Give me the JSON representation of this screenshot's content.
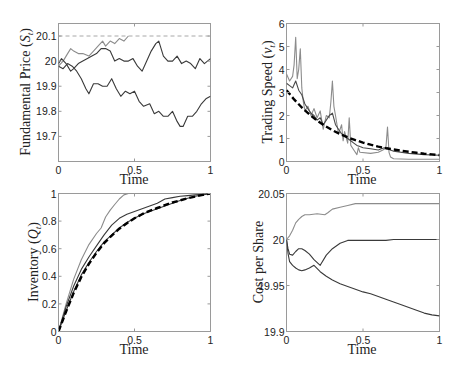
{
  "chart_data": [
    {
      "id": "price",
      "type": "line",
      "title": "",
      "xlabel": "Time",
      "ylabel": "Fundamental Price (S_t)",
      "ylabel_main": "Fundamental Price ",
      "ylabel_sym": "S",
      "ylabel_sub": "t",
      "xlim": [
        0,
        1
      ],
      "ylim": [
        19.6,
        20.15
      ],
      "xticks": [
        0,
        0.5,
        1
      ],
      "xtick_labels": [
        "0",
        "0.5",
        "1"
      ],
      "yticks": [
        19.7,
        19.8,
        19.9,
        20,
        20.1
      ],
      "ytick_labels": [
        "19.7",
        "19.8",
        "19.9",
        "20",
        "20.1"
      ],
      "grid": false,
      "series": [
        {
          "name": "barrier",
          "style": "dashed",
          "color": "#a8a8a8",
          "x": [
            0,
            1
          ],
          "y": [
            20.1,
            20.1
          ]
        },
        {
          "name": "path-hits-barrier",
          "style": "solid",
          "color": "#8c8c8c",
          "x": [
            0,
            0.03,
            0.06,
            0.08,
            0.1,
            0.13,
            0.16,
            0.2,
            0.23,
            0.26,
            0.29,
            0.31,
            0.34,
            0.37,
            0.4,
            0.43,
            0.46
          ],
          "y": [
            19.98,
            20.0,
            20.03,
            20.05,
            20.04,
            20.03,
            20.03,
            20.02,
            20.04,
            20.06,
            20.08,
            20.06,
            20.08,
            20.07,
            20.09,
            20.08,
            20.1
          ]
        },
        {
          "name": "path-mid",
          "style": "solid",
          "color": "#3a3a3a",
          "x": [
            0,
            0.02,
            0.05,
            0.08,
            0.1,
            0.13,
            0.16,
            0.19,
            0.22,
            0.25,
            0.28,
            0.31,
            0.34,
            0.37,
            0.4,
            0.43,
            0.46,
            0.49,
            0.52,
            0.55,
            0.58,
            0.61,
            0.64,
            0.66,
            0.69,
            0.72,
            0.75,
            0.78,
            0.81,
            0.84,
            0.87,
            0.9,
            0.93,
            0.96,
            1.0
          ],
          "y": [
            19.99,
            20.01,
            19.99,
            19.96,
            19.97,
            19.99,
            20.0,
            20.01,
            20.02,
            20.03,
            20.05,
            20.05,
            20.04,
            20.0,
            20.01,
            20.0,
            20.0,
            20.01,
            19.98,
            19.96,
            20.0,
            20.04,
            20.07,
            20.08,
            20.02,
            20.0,
            20.0,
            20.02,
            19.99,
            20.0,
            19.99,
            19.97,
            20.01,
            19.99,
            20.01
          ]
        },
        {
          "name": "path-low",
          "style": "solid",
          "color": "#3a3a3a",
          "x": [
            0,
            0.03,
            0.06,
            0.09,
            0.12,
            0.15,
            0.18,
            0.2,
            0.23,
            0.26,
            0.29,
            0.32,
            0.35,
            0.38,
            0.41,
            0.44,
            0.47,
            0.5,
            0.53,
            0.56,
            0.6,
            0.63,
            0.66,
            0.69,
            0.72,
            0.75,
            0.78,
            0.8,
            0.82,
            0.85,
            0.88,
            0.91,
            0.94,
            0.97,
            1.0
          ],
          "y": [
            19.98,
            19.97,
            19.99,
            19.98,
            19.96,
            19.93,
            19.89,
            19.87,
            19.91,
            19.91,
            19.9,
            19.9,
            19.93,
            19.89,
            19.86,
            19.88,
            19.87,
            19.88,
            19.84,
            19.82,
            19.83,
            19.79,
            19.8,
            19.78,
            19.78,
            19.8,
            19.76,
            19.74,
            19.74,
            19.78,
            19.78,
            19.8,
            19.83,
            19.85,
            19.86
          ]
        }
      ]
    },
    {
      "id": "speed",
      "type": "line",
      "title": "",
      "xlabel": "Time",
      "ylabel": "Trading Speed (ν_t)",
      "ylabel_main": "Trading Speed ",
      "ylabel_sym": "ν",
      "ylabel_sub": "t",
      "xlim": [
        0,
        1
      ],
      "ylim": [
        0,
        6
      ],
      "xticks": [
        0,
        0.5,
        1
      ],
      "xtick_labels": [
        "0",
        "0.5",
        "1"
      ],
      "yticks": [
        0,
        1,
        2,
        3,
        4,
        5,
        6
      ],
      "ytick_labels": [
        "0",
        "1",
        "2",
        "3",
        "4",
        "5",
        "6"
      ],
      "grid": false,
      "series": [
        {
          "name": "path-light",
          "style": "solid",
          "color": "#8c8c8c",
          "x": [
            0,
            0.02,
            0.04,
            0.05,
            0.06,
            0.07,
            0.08,
            0.09,
            0.1,
            0.11,
            0.12,
            0.14,
            0.16,
            0.18,
            0.2,
            0.22,
            0.24,
            0.26,
            0.28,
            0.29,
            0.3,
            0.31,
            0.32,
            0.34,
            0.36,
            0.37,
            0.38,
            0.4,
            0.41,
            0.42,
            0.44,
            0.46,
            0.47,
            0.48,
            0.55,
            0.6,
            0.63,
            0.65,
            0.66,
            0.67,
            0.68,
            0.7,
            0.8,
            1.0
          ],
          "y": [
            3.8,
            3.5,
            3.7,
            4.2,
            5.4,
            3.6,
            4.0,
            4.9,
            3.2,
            2.6,
            2.2,
            2.4,
            2.0,
            2.3,
            1.9,
            2.2,
            1.4,
            2.0,
            1.9,
            2.6,
            3.5,
            2.4,
            2.0,
            1.2,
            1.6,
            0.9,
            1.3,
            0.8,
            1.9,
            0.7,
            0.5,
            0.3,
            0.6,
            0.4,
            0.35,
            0.4,
            0.5,
            0.6,
            1.5,
            0.4,
            0.2,
            0.12,
            0.1,
            0.1
          ]
        },
        {
          "name": "path-dark",
          "style": "solid",
          "color": "#4a4a4a",
          "x": [
            0,
            0.02,
            0.04,
            0.06,
            0.08,
            0.1,
            0.12,
            0.14,
            0.16,
            0.18,
            0.2,
            0.22,
            0.24,
            0.26,
            0.28,
            0.3,
            0.32,
            0.34,
            0.36,
            0.38,
            0.4,
            0.42,
            0.44,
            0.46,
            0.48,
            0.5,
            0.55,
            0.6,
            0.62,
            0.64,
            0.66,
            0.68,
            0.7,
            0.8,
            0.9,
            1.0
          ],
          "y": [
            3.4,
            3.3,
            3.2,
            3.5,
            3.1,
            2.9,
            2.5,
            2.3,
            2.1,
            2.0,
            1.8,
            1.9,
            1.6,
            1.8,
            2.0,
            2.1,
            1.6,
            1.4,
            1.2,
            1.1,
            1.0,
            0.9,
            0.8,
            0.7,
            0.65,
            0.6,
            0.55,
            0.5,
            0.55,
            0.6,
            0.6,
            0.5,
            0.45,
            0.35,
            0.3,
            0.27
          ]
        },
        {
          "name": "optimal-speed",
          "style": "dashed-bold",
          "color": "#000000",
          "x": [
            0,
            0.05,
            0.1,
            0.15,
            0.2,
            0.25,
            0.3,
            0.35,
            0.4,
            0.45,
            0.5,
            0.55,
            0.6,
            0.65,
            0.7,
            0.75,
            0.8,
            0.85,
            0.9,
            0.95,
            1.0
          ],
          "y": [
            3.1,
            2.7,
            2.35,
            2.05,
            1.78,
            1.55,
            1.36,
            1.19,
            1.05,
            0.93,
            0.82,
            0.73,
            0.65,
            0.58,
            0.52,
            0.47,
            0.42,
            0.38,
            0.34,
            0.31,
            0.28
          ]
        }
      ]
    },
    {
      "id": "inventory",
      "type": "line",
      "title": "",
      "xlabel": "Time",
      "ylabel": "Inventory (Q_t)",
      "ylabel_main": "Inventory ",
      "ylabel_sym": "Q",
      "ylabel_sub": "t",
      "xlim": [
        0,
        1
      ],
      "ylim": [
        0,
        1
      ],
      "xticks": [
        0,
        0.5,
        1
      ],
      "xtick_labels": [
        "0",
        "0.5",
        "1"
      ],
      "yticks": [
        0,
        0.2,
        0.4,
        0.6,
        0.8,
        1
      ],
      "ytick_labels": [
        "0",
        "0.2",
        "0.4",
        "0.6",
        "0.8",
        "1"
      ],
      "grid": false,
      "series": [
        {
          "name": "path-fast",
          "style": "solid",
          "color": "#8c8c8c",
          "x": [
            0,
            0.05,
            0.1,
            0.15,
            0.2,
            0.25,
            0.28,
            0.31,
            0.34,
            0.37,
            0.4,
            0.43,
            0.46,
            1.0
          ],
          "y": [
            0,
            0.2,
            0.38,
            0.52,
            0.63,
            0.71,
            0.75,
            0.83,
            0.88,
            0.92,
            0.96,
            0.99,
            1.0,
            1.0
          ]
        },
        {
          "name": "path-mid",
          "style": "solid",
          "color": "#3a3a3a",
          "x": [
            0,
            0.05,
            0.1,
            0.15,
            0.2,
            0.25,
            0.3,
            0.35,
            0.4,
            0.45,
            0.5,
            0.55,
            0.6,
            0.65,
            0.7,
            0.75,
            0.8,
            0.85,
            0.9,
            0.95,
            1.0
          ],
          "y": [
            0,
            0.18,
            0.33,
            0.45,
            0.54,
            0.62,
            0.7,
            0.77,
            0.82,
            0.85,
            0.87,
            0.89,
            0.91,
            0.93,
            0.96,
            0.97,
            0.98,
            0.985,
            0.99,
            0.995,
            1.0
          ]
        },
        {
          "name": "path-near-optimal",
          "style": "solid",
          "color": "#3a3a3a",
          "x": [
            0,
            0.05,
            0.1,
            0.15,
            0.2,
            0.25,
            0.3,
            0.35,
            0.4,
            0.45,
            0.5,
            0.55,
            0.6,
            0.65,
            0.7,
            0.75,
            0.8,
            0.85,
            0.9,
            0.95,
            1.0
          ],
          "y": [
            0,
            0.15,
            0.29,
            0.41,
            0.5,
            0.58,
            0.65,
            0.7,
            0.75,
            0.79,
            0.82,
            0.85,
            0.87,
            0.89,
            0.91,
            0.93,
            0.95,
            0.965,
            0.98,
            0.99,
            1.0
          ]
        },
        {
          "name": "optimal-inventory",
          "style": "dashed-bold",
          "color": "#000000",
          "x": [
            0,
            0.05,
            0.1,
            0.15,
            0.2,
            0.25,
            0.3,
            0.35,
            0.4,
            0.45,
            0.5,
            0.55,
            0.6,
            0.65,
            0.7,
            0.75,
            0.8,
            0.85,
            0.9,
            0.95,
            1.0
          ],
          "y": [
            0,
            0.145,
            0.28,
            0.395,
            0.49,
            0.57,
            0.64,
            0.695,
            0.745,
            0.785,
            0.82,
            0.85,
            0.875,
            0.895,
            0.915,
            0.935,
            0.95,
            0.965,
            0.978,
            0.99,
            1.0
          ]
        }
      ]
    },
    {
      "id": "cost",
      "type": "line",
      "title": "",
      "xlabel": "Time",
      "ylabel": "Cost per Share",
      "ylabel_main": "Cost per Share",
      "ylabel_sym": "",
      "ylabel_sub": "",
      "xlim": [
        0,
        1
      ],
      "ylim": [
        19.9,
        20.05
      ],
      "xticks": [
        0,
        0.5,
        1
      ],
      "xtick_labels": [
        "0",
        "0.5",
        "1"
      ],
      "yticks": [
        19.9,
        19.95,
        20,
        20.05
      ],
      "ytick_labels": [
        "19.9",
        "19.95",
        "20",
        "20.05"
      ],
      "grid": false,
      "series": [
        {
          "name": "cost-high",
          "style": "solid",
          "color": "#8c8c8c",
          "x": [
            0,
            0.02,
            0.04,
            0.06,
            0.08,
            0.1,
            0.12,
            0.15,
            0.2,
            0.25,
            0.27,
            0.3,
            0.35,
            0.4,
            0.45,
            0.5,
            0.6,
            0.7,
            0.8,
            0.9,
            1.0
          ],
          "y": [
            20.0,
            20.004,
            20.01,
            20.018,
            20.022,
            20.025,
            20.027,
            20.027,
            20.028,
            20.027,
            20.029,
            20.033,
            20.035,
            20.037,
            20.039,
            20.039,
            20.039,
            20.039,
            20.039,
            20.039,
            20.039
          ]
        },
        {
          "name": "cost-mid",
          "style": "solid",
          "color": "#3a3a3a",
          "x": [
            0,
            0.01,
            0.02,
            0.04,
            0.06,
            0.08,
            0.1,
            0.12,
            0.15,
            0.18,
            0.22,
            0.26,
            0.3,
            0.35,
            0.4,
            0.45,
            0.5,
            0.55,
            0.6,
            0.65,
            0.7,
            0.8,
            0.9,
            1.0
          ],
          "y": [
            20.0,
            19.99,
            19.984,
            19.983,
            19.987,
            19.99,
            19.99,
            19.988,
            19.984,
            19.978,
            19.972,
            19.983,
            19.99,
            19.996,
            19.999,
            19.999,
            19.999,
            19.999,
            19.999,
            19.999,
            20.0,
            20.0,
            20.0,
            20.0
          ]
        },
        {
          "name": "cost-low",
          "style": "solid",
          "color": "#3a3a3a",
          "x": [
            0,
            0.01,
            0.02,
            0.04,
            0.06,
            0.08,
            0.1,
            0.12,
            0.15,
            0.18,
            0.22,
            0.26,
            0.3,
            0.35,
            0.4,
            0.45,
            0.5,
            0.55,
            0.6,
            0.65,
            0.7,
            0.75,
            0.8,
            0.85,
            0.9,
            0.95,
            1.0
          ],
          "y": [
            20.0,
            19.985,
            19.976,
            19.972,
            19.969,
            19.967,
            19.966,
            19.967,
            19.969,
            19.972,
            19.965,
            19.96,
            19.956,
            19.952,
            19.949,
            19.946,
            19.943,
            19.941,
            19.938,
            19.935,
            19.932,
            19.929,
            19.926,
            19.923,
            19.92,
            19.918,
            19.917
          ]
        }
      ]
    }
  ]
}
